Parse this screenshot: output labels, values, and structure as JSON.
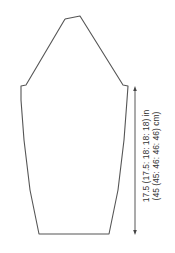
{
  "diagram": {
    "type": "knitting-schematic",
    "outline_color": "#555555",
    "measurements": {
      "sleeve_length": {
        "line1": "17.5 (17.5: 18: 18: 18) in",
        "line2": "(45 (45: 46: 46: 46) cm)"
      }
    }
  }
}
